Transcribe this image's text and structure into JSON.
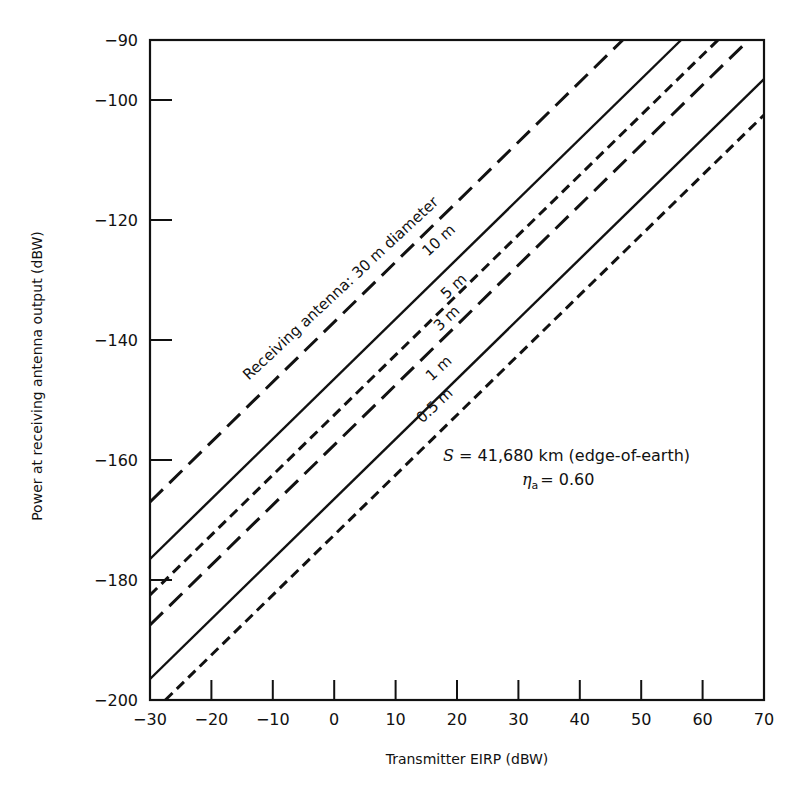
{
  "chart_data": {
    "type": "line",
    "title": "",
    "xlabel": "Transmitter EIRP (dBW)",
    "ylabel": "Power at receiving antenna output (dBW)",
    "xlim": [
      -30,
      70
    ],
    "ylim": [
      -200,
      -90
    ],
    "xticks": [
      -30,
      -20,
      -10,
      0,
      10,
      20,
      30,
      40,
      50,
      60,
      70
    ],
    "yticks": [
      -90,
      -100,
      -120,
      -140,
      -160,
      -180,
      -200
    ],
    "xtick_labels": [
      "−30",
      "−20",
      "−10",
      "0",
      "10",
      "20",
      "30",
      "40",
      "50",
      "60",
      "70"
    ],
    "ytick_labels": [
      "−90",
      "−100",
      "−120",
      "−140",
      "−160",
      "−180",
      "−200"
    ],
    "grid": false,
    "legend": "none (lines labeled inline)",
    "series": [
      {
        "name": "30 m",
        "label": "Receiving antenna: 30 m diameter",
        "style": "long-dash",
        "offset_db": -137.0,
        "x": [
          -30,
          47
        ],
        "y": [
          -167,
          -90
        ]
      },
      {
        "name": "10 m",
        "label": "10 m",
        "style": "solid",
        "offset_db": -146.5,
        "x": [
          -30,
          56.5
        ],
        "y": [
          -176.5,
          -90
        ]
      },
      {
        "name": "5 m",
        "label": "5 m",
        "style": "short-dash",
        "offset_db": -152.5,
        "x": [
          -30,
          62.5
        ],
        "y": [
          -182.5,
          -90
        ]
      },
      {
        "name": "3 m",
        "label": "3 m",
        "style": "long-dash",
        "offset_db": -157.5,
        "x": [
          -30,
          67.5
        ],
        "y": [
          -187.5,
          -90
        ]
      },
      {
        "name": "1 m",
        "label": "1 m",
        "style": "solid",
        "offset_db": -166.5,
        "x": [
          -30,
          70
        ],
        "y": [
          -196.5,
          -96.5
        ]
      },
      {
        "name": "0.5 m",
        "label": "0.5 m",
        "style": "short-dash",
        "offset_db": -172.5,
        "x": [
          -27.5,
          70
        ],
        "y": [
          -200,
          -102.5
        ]
      }
    ],
    "annotations": {
      "range": "S = 41,680 km (edge-of-earth)",
      "range_var": "S",
      "range_text": " = 41,680 km (edge-of-earth)",
      "efficiency_var": "η",
      "efficiency_sub": "a",
      "efficiency_text": "= 0.60"
    }
  },
  "colors": {
    "ink": "#111111",
    "background": "#ffffff"
  }
}
